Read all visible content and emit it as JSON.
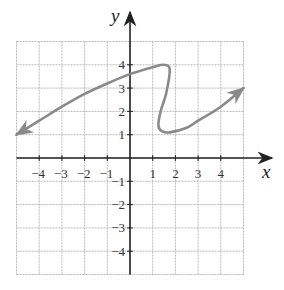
{
  "chart_data": {
    "type": "line",
    "title": "",
    "xlabel": "x",
    "ylabel": "y",
    "xlim": [
      -5,
      5
    ],
    "ylim": [
      -5,
      5
    ],
    "grid": true,
    "x_ticks": [
      -4,
      -3,
      -2,
      -1,
      1,
      2,
      3,
      4
    ],
    "x_tick_labels": [
      "−4",
      "−3",
      "−2",
      "−1",
      "1",
      "2",
      "3",
      "4"
    ],
    "y_ticks": [
      4,
      3,
      2,
      1,
      -1,
      -2,
      -3,
      -4
    ],
    "y_tick_labels": [
      "4",
      "3",
      "2",
      "1",
      "−1",
      "−2",
      "−3",
      "−4"
    ],
    "series": [
      {
        "name": "curve",
        "color": "#8a8a8a",
        "arrows": "both ends",
        "points": [
          [
            -5,
            1
          ],
          [
            -4,
            1.6
          ],
          [
            -3,
            2.2
          ],
          [
            -2,
            2.75
          ],
          [
            -1,
            3.2
          ],
          [
            0,
            3.6
          ],
          [
            1,
            3.9
          ],
          [
            1.5,
            4
          ],
          [
            1.75,
            3.8
          ],
          [
            1.6,
            2.8
          ],
          [
            1.35,
            2
          ],
          [
            1.25,
            1.4
          ],
          [
            1.4,
            1.15
          ],
          [
            1.75,
            1.1
          ],
          [
            2.5,
            1.3
          ],
          [
            3,
            1.6
          ],
          [
            4,
            2.2
          ],
          [
            5,
            3
          ]
        ]
      }
    ],
    "colors": {
      "grid": "#b8b8b8",
      "axes": "#222222",
      "curve": "#8a8a8a"
    }
  }
}
